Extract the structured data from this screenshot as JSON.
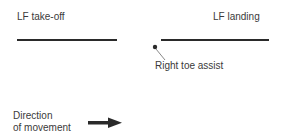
{
  "labels": {
    "lf_takeoff": "LF take-off",
    "lf_landing": "LF landing",
    "right_toe_assist": "Right toe assist",
    "direction_line1": "Direction",
    "direction_line2": "of movement"
  },
  "colors": {
    "ink": "#2a2a2a",
    "text": "#3a3a3a",
    "background": "#ffffff"
  }
}
